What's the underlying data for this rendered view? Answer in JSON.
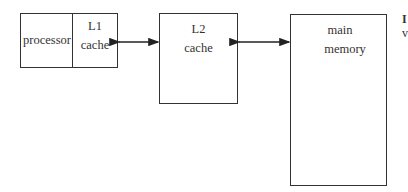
{
  "diagram": {
    "nodes": [
      {
        "id": "processor",
        "label": "processor"
      },
      {
        "id": "l1",
        "line1": "L1",
        "line2": "cache"
      },
      {
        "id": "l2",
        "line1": "L2",
        "line2": "cache"
      },
      {
        "id": "mem",
        "line1": "main",
        "line2": "memory"
      }
    ],
    "edges": [
      {
        "from": "l1",
        "to": "l2",
        "type": "bidirectional"
      },
      {
        "from": "l2",
        "to": "mem",
        "type": "bidirectional"
      }
    ],
    "cropped_edge_text": {
      "line1": "I",
      "line2": "v"
    }
  }
}
